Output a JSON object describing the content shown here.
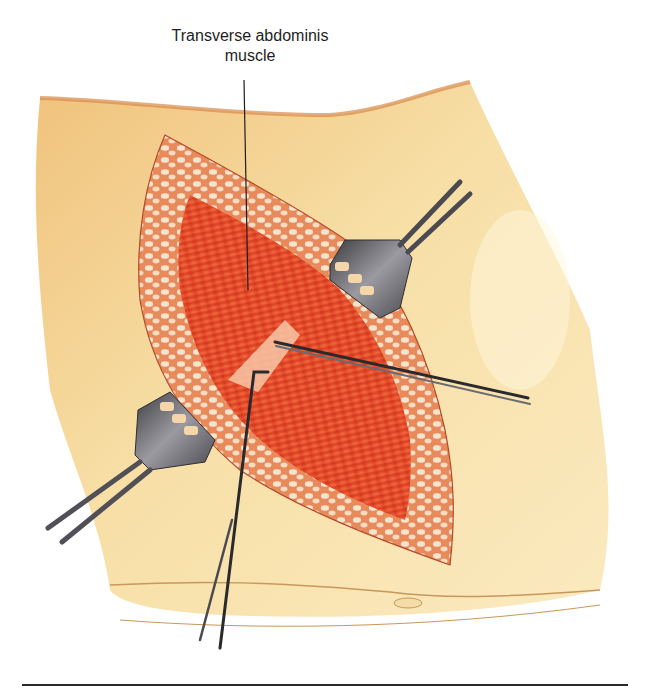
{
  "figure": {
    "label": {
      "line1": "Transverse abdominis",
      "line2": "muscle"
    },
    "elements": [
      "skin-flank",
      "subcutaneous-fat-border",
      "transverse-abdominis-muscle",
      "muscle-fiber-split",
      "retractor-upper-right",
      "retractor-lower-left",
      "forceps-right",
      "hook-instrument-lower"
    ],
    "colors": {
      "skin": "#f3d79a",
      "skin_shadow": "#e6b56c",
      "muscle": "#e8502a",
      "fat": "#f6dcc0",
      "instrument": "#5a5a5e",
      "label_text": "#1e1e1e"
    }
  }
}
